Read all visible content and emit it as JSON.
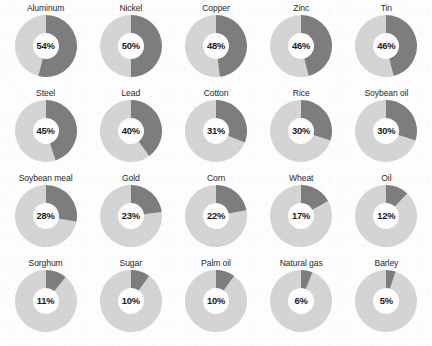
{
  "chart_data": {
    "type": "pie",
    "title": "",
    "subtitle": "",
    "xlabel": "",
    "ylabel": "",
    "legend_position": "none",
    "grid": false,
    "layout": {
      "rows": 4,
      "columns": 5,
      "chart_style": "donut",
      "hole_ratio": 0.42,
      "start_angle_deg": 0,
      "direction": "clockwise"
    },
    "value_suffix": "%",
    "series": [
      {
        "name": "Share",
        "color": "#7d7d7d"
      },
      {
        "name": "Remainder",
        "color": "#d4d4d4"
      }
    ],
    "categories": [
      "Aluminum",
      "Nickel",
      "Copper",
      "Zinc",
      "Tin",
      "Steel",
      "Lead",
      "Cotton",
      "Rice",
      "Soybean oil",
      "Soybean meal",
      "Gold",
      "Corn",
      "Wheat",
      "Oil",
      "Sorghum",
      "Sugar",
      "Palm oil",
      "Natural gas",
      "Barley"
    ],
    "values": [
      54,
      50,
      48,
      46,
      46,
      45,
      40,
      31,
      30,
      30,
      28,
      23,
      22,
      17,
      12,
      11,
      10,
      10,
      6,
      5
    ],
    "items": [
      {
        "label": "Aluminum",
        "value": 54,
        "value_text": "54%"
      },
      {
        "label": "Nickel",
        "value": 50,
        "value_text": "50%"
      },
      {
        "label": "Copper",
        "value": 48,
        "value_text": "48%"
      },
      {
        "label": "Zinc",
        "value": 46,
        "value_text": "46%"
      },
      {
        "label": "Tin",
        "value": 46,
        "value_text": "46%"
      },
      {
        "label": "Steel",
        "value": 45,
        "value_text": "45%"
      },
      {
        "label": "Lead",
        "value": 40,
        "value_text": "40%"
      },
      {
        "label": "Cotton",
        "value": 31,
        "value_text": "31%"
      },
      {
        "label": "Rice",
        "value": 30,
        "value_text": "30%"
      },
      {
        "label": "Soybean oil",
        "value": 30,
        "value_text": "30%"
      },
      {
        "label": "Soybean meal",
        "value": 28,
        "value_text": "28%"
      },
      {
        "label": "Gold",
        "value": 23,
        "value_text": "23%"
      },
      {
        "label": "Corn",
        "value": 22,
        "value_text": "22%"
      },
      {
        "label": "Wheat",
        "value": 17,
        "value_text": "17%"
      },
      {
        "label": "Oil",
        "value": 12,
        "value_text": "12%"
      },
      {
        "label": "Sorghum",
        "value": 11,
        "value_text": "11%"
      },
      {
        "label": "Sugar",
        "value": 10,
        "value_text": "10%"
      },
      {
        "label": "Palm oil",
        "value": 10,
        "value_text": "10%"
      },
      {
        "label": "Natural gas",
        "value": 6,
        "value_text": "6%"
      },
      {
        "label": "Barley",
        "value": 5,
        "value_text": "5%"
      }
    ]
  },
  "colors": {
    "share_arc": "#7d7d7d",
    "remainder_arc": "#d4d4d4",
    "label_text": "#2a2a2a",
    "value_text": "#1b1b1b",
    "background": "#fdfdfd",
    "hole": "#ffffff"
  }
}
